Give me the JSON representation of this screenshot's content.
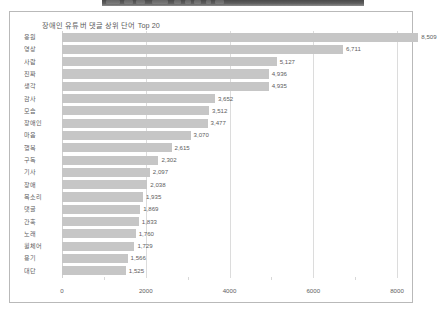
{
  "toolbar": {
    "present": true,
    "color": "#555555"
  },
  "chart_data": {
    "type": "bar",
    "orientation": "horizontal",
    "title": "장애인 유튜버 댓글 상위 단어 Top 20",
    "xlabel": "",
    "ylabel": "",
    "xlim": [
      0,
      8500
    ],
    "xticks": [
      "0",
      "2000",
      "4000",
      "6000",
      "8000"
    ],
    "xtick_values": [
      0,
      2000,
      4000,
      6000,
      8000
    ],
    "grid": true,
    "legend": false,
    "bar_color": "#c6c6c6",
    "categories": [
      "응원",
      "영상",
      "사람",
      "진짜",
      "생각",
      "감사",
      "모습",
      "장애인",
      "마음",
      "행복",
      "구독",
      "기사",
      "장애",
      "목소리",
      "댓글",
      "간혹",
      "노래",
      "휠체어",
      "용기",
      "대단"
    ],
    "values": [
      8509,
      6711,
      5127,
      4936,
      4935,
      3652,
      3512,
      3477,
      3070,
      2615,
      2302,
      2097,
      2038,
      1935,
      1869,
      1833,
      1760,
      1729,
      1566,
      1525
    ],
    "value_labels": [
      "8,509",
      "6,711",
      "5,127",
      "4,936",
      "4,935",
      "3,652",
      "3,512",
      "3,477",
      "3,070",
      "2,615",
      "2,302",
      "2,097",
      "2,038",
      "1,935",
      "1,869",
      "1,833",
      "1,760",
      "1,729",
      "1,566",
      "1,525"
    ]
  }
}
